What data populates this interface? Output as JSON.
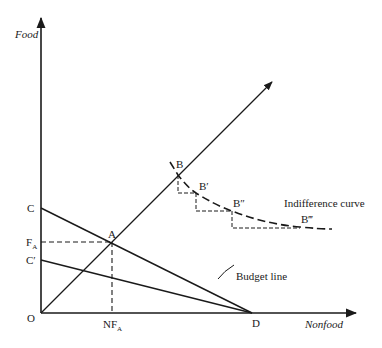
{
  "diagram": {
    "type": "economics-indifference-diagram",
    "axes": {
      "y_label": "Food",
      "x_label": "Nonfood",
      "origin_label": "O"
    },
    "points": {
      "C": "C",
      "C_prime": "C′",
      "F_A_main": "F",
      "F_A_sub": "A",
      "NF_A_main": "NF",
      "NF_A_sub": "A",
      "A": "A",
      "D": "D",
      "B": "B",
      "B_prime": "B′",
      "B_double_prime": "B″",
      "B_triple_prime": "B‴"
    },
    "annotations": {
      "indifference_curve": "Indifference curve",
      "budget_line": "Budget line"
    },
    "colors": {
      "ink": "#1a1a1a",
      "background": "#ffffff"
    }
  }
}
